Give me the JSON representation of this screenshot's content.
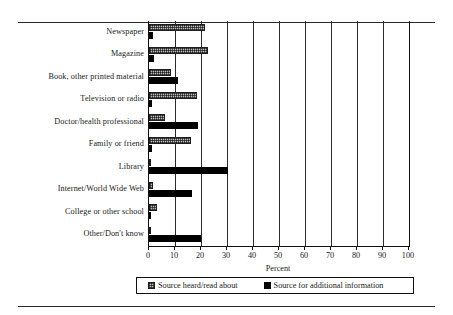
{
  "chart_data": {
    "type": "bar",
    "orientation": "horizontal",
    "title": "",
    "xlabel": "Percent",
    "ylabel": "",
    "xlim": [
      0,
      100
    ],
    "xticks": [
      0,
      10,
      20,
      30,
      40,
      50,
      60,
      70,
      80,
      90,
      100
    ],
    "grid": true,
    "legend_position": "bottom",
    "categories": [
      "Newspaper",
      "Magazine",
      "Book, other printed material",
      "Television or radio",
      "Doctor/health professional",
      "Family or friend",
      "Library",
      "Internet/World Wide Web",
      "College or other school",
      "Other/Don't know"
    ],
    "series": [
      {
        "name": "Source heard/read about",
        "style": "hatched-gray",
        "color": "#b9b9b9",
        "values": [
          21.5,
          22.5,
          8.5,
          18.5,
          6.0,
          16.0,
          0.6,
          1.5,
          3.0,
          0.8
        ]
      },
      {
        "name": "Source for additional information",
        "style": "solid-black",
        "color": "#000000",
        "values": [
          1.5,
          1.8,
          11.0,
          1.2,
          19.0,
          1.0,
          30.5,
          16.5,
          0.8,
          20.0
        ]
      }
    ]
  },
  "axis": {
    "title": "Percent",
    "tick_labels": [
      "0",
      "10",
      "20",
      "30",
      "40",
      "50",
      "60",
      "70",
      "80",
      "90",
      "100"
    ]
  },
  "legend": {
    "entries": [
      {
        "label": "Source heard/read about"
      },
      {
        "label": "Source for additional information"
      }
    ]
  }
}
